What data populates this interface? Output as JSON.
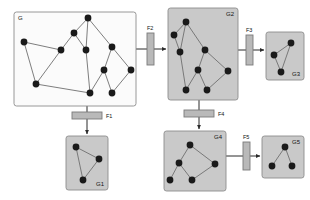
{
  "diagram": {
    "colors": {
      "panel_main_fill": "#fbfbfb",
      "panel_sub_fill": "#c9c9c9",
      "panel_stroke": "#8d8d8d",
      "node_fill": "#1a1a1a",
      "edge_stroke": "#6f6f6f",
      "filter_fill": "#b9b9b9",
      "filter_stroke": "#7a7a7a",
      "arrow_stroke": "#2b2b2b",
      "background": "#ffffff"
    },
    "panels": [
      {
        "id": "G",
        "label": "G",
        "label_pos": "top-left",
        "x": 14,
        "y": 12,
        "w": 122,
        "h": 94,
        "variant": "main",
        "nodes": [
          {
            "id": "n1",
            "x": 24,
            "y": 42
          },
          {
            "id": "n2",
            "x": 36,
            "y": 84
          },
          {
            "id": "n3",
            "x": 61,
            "y": 50
          },
          {
            "id": "n4",
            "x": 74,
            "y": 33
          },
          {
            "id": "n5",
            "x": 86,
            "y": 50
          },
          {
            "id": "n6",
            "x": 88,
            "y": 18
          },
          {
            "id": "n7",
            "x": 112,
            "y": 47
          },
          {
            "id": "n8",
            "x": 104,
            "y": 70
          },
          {
            "id": "n9",
            "x": 90,
            "y": 93
          },
          {
            "id": "n10",
            "x": 112,
            "y": 93
          },
          {
            "id": "n11",
            "x": 131,
            "y": 70
          }
        ],
        "edges": [
          [
            "n1",
            "n2"
          ],
          [
            "n1",
            "n3"
          ],
          [
            "n2",
            "n3"
          ],
          [
            "n3",
            "n4"
          ],
          [
            "n4",
            "n5"
          ],
          [
            "n4",
            "n6"
          ],
          [
            "n5",
            "n6"
          ],
          [
            "n5",
            "n9"
          ],
          [
            "n6",
            "n7"
          ],
          [
            "n7",
            "n8"
          ],
          [
            "n7",
            "n11"
          ],
          [
            "n8",
            "n9"
          ],
          [
            "n8",
            "n10"
          ],
          [
            "n10",
            "n11"
          ],
          [
            "n9",
            "n2"
          ]
        ]
      },
      {
        "id": "G2",
        "label": "G2",
        "label_pos": "top-right",
        "x": 168,
        "y": 8,
        "w": 70,
        "h": 92,
        "variant": "sub",
        "nodes": [
          {
            "id": "a1",
            "x": 186,
            "y": 22
          },
          {
            "id": "a2",
            "x": 174,
            "y": 35
          },
          {
            "id": "a3",
            "x": 180,
            "y": 52
          },
          {
            "id": "a4",
            "x": 205,
            "y": 50
          },
          {
            "id": "a5",
            "x": 198,
            "y": 70
          },
          {
            "id": "a6",
            "x": 228,
            "y": 71
          },
          {
            "id": "a7",
            "x": 186,
            "y": 90
          },
          {
            "id": "a8",
            "x": 207,
            "y": 90
          }
        ],
        "edges": [
          [
            "a1",
            "a2"
          ],
          [
            "a1",
            "a3"
          ],
          [
            "a1",
            "a4"
          ],
          [
            "a2",
            "a3"
          ],
          [
            "a3",
            "a7"
          ],
          [
            "a4",
            "a5"
          ],
          [
            "a4",
            "a6"
          ],
          [
            "a5",
            "a7"
          ],
          [
            "a5",
            "a8"
          ],
          [
            "a6",
            "a8"
          ]
        ]
      },
      {
        "id": "G3",
        "label": "G3",
        "label_pos": "bottom-right",
        "x": 266,
        "y": 32,
        "w": 38,
        "h": 48,
        "variant": "sub",
        "nodes": [
          {
            "id": "b1",
            "x": 291,
            "y": 43
          },
          {
            "id": "b2",
            "x": 274,
            "y": 55
          },
          {
            "id": "b3",
            "x": 281,
            "y": 72
          }
        ],
        "edges": [
          [
            "b1",
            "b2"
          ],
          [
            "b1",
            "b3"
          ],
          [
            "b2",
            "b3"
          ]
        ]
      },
      {
        "id": "G1",
        "label": "G1",
        "label_pos": "bottom-right",
        "x": 66,
        "y": 136,
        "w": 42,
        "h": 54,
        "variant": "sub",
        "nodes": [
          {
            "id": "c1",
            "x": 76,
            "y": 147
          },
          {
            "id": "c2",
            "x": 99,
            "y": 159
          },
          {
            "id": "c3",
            "x": 83,
            "y": 180
          }
        ],
        "edges": [
          [
            "c1",
            "c2"
          ],
          [
            "c1",
            "c3"
          ],
          [
            "c2",
            "c3"
          ]
        ]
      },
      {
        "id": "G4",
        "label": "G4",
        "label_pos": "top-right",
        "x": 164,
        "y": 131,
        "w": 62,
        "h": 60,
        "variant": "sub",
        "nodes": [
          {
            "id": "d1",
            "x": 190,
            "y": 145
          },
          {
            "id": "d2",
            "x": 179,
            "y": 163
          },
          {
            "id": "d3",
            "x": 215,
            "y": 164
          },
          {
            "id": "d4",
            "x": 170,
            "y": 180
          },
          {
            "id": "d5",
            "x": 192,
            "y": 180
          }
        ],
        "edges": [
          [
            "d1",
            "d2"
          ],
          [
            "d1",
            "d3"
          ],
          [
            "d2",
            "d4"
          ],
          [
            "d2",
            "d5"
          ],
          [
            "d3",
            "d5"
          ]
        ]
      },
      {
        "id": "G5",
        "label": "G5",
        "label_pos": "top-right",
        "x": 262,
        "y": 136,
        "w": 42,
        "h": 42,
        "variant": "sub",
        "nodes": [
          {
            "id": "e1",
            "x": 285,
            "y": 147
          },
          {
            "id": "e2",
            "x": 272,
            "y": 166
          },
          {
            "id": "e3",
            "x": 292,
            "y": 166
          }
        ],
        "edges": [
          [
            "e1",
            "e2"
          ],
          [
            "e1",
            "e3"
          ]
        ]
      }
    ],
    "filters": [
      {
        "id": "F1",
        "label": "F1",
        "orientation": "horizontal",
        "x": 72,
        "y": 112,
        "w": 30,
        "h": 7,
        "label_x": 106,
        "label_y": 118
      },
      {
        "id": "F2",
        "label": "F2",
        "orientation": "vertical",
        "x": 147,
        "y": 33,
        "w": 7,
        "h": 32,
        "label_x": 147,
        "label_y": 30
      },
      {
        "id": "F3",
        "label": "F3",
        "orientation": "vertical",
        "x": 246,
        "y": 35,
        "w": 7,
        "h": 30,
        "label_x": 246,
        "label_y": 32
      },
      {
        "id": "F4",
        "label": "F4",
        "orientation": "horizontal",
        "x": 184,
        "y": 110,
        "w": 30,
        "h": 7,
        "label_x": 218,
        "label_y": 116
      },
      {
        "id": "F5",
        "label": "F5",
        "orientation": "vertical",
        "x": 243,
        "y": 142,
        "w": 7,
        "h": 28,
        "label_x": 243,
        "label_y": 139
      }
    ],
    "connectors": [
      {
        "id": "G-to-F2",
        "from": "G",
        "to": "F2",
        "path": "M136,49 L147,49",
        "arrow": false
      },
      {
        "id": "F2-to-G2",
        "from": "F2",
        "to": "G2",
        "path": "M154,49 L166,49",
        "arrow": true
      },
      {
        "id": "G2-to-F3",
        "from": "G2",
        "to": "F3",
        "path": "M238,50 L246,50",
        "arrow": false
      },
      {
        "id": "F3-to-G3",
        "from": "F3",
        "to": "G3",
        "path": "M253,50 L264,50",
        "arrow": true
      },
      {
        "id": "G-to-F1",
        "from": "G",
        "to": "F1",
        "path": "M87,106 L87,112",
        "arrow": false
      },
      {
        "id": "F1-to-G1",
        "from": "F1",
        "to": "G1",
        "path": "M87,119 L87,134",
        "arrow": true
      },
      {
        "id": "G2-to-F4",
        "from": "G2",
        "to": "F4",
        "path": "M199,100 L199,110",
        "arrow": false
      },
      {
        "id": "F4-to-G4",
        "from": "F4",
        "to": "G4",
        "path": "M199,117 L199,129",
        "arrow": true
      },
      {
        "id": "G4-to-F5",
        "from": "G4",
        "to": "F5",
        "path": "M226,156 L243,156",
        "arrow": false
      },
      {
        "id": "F5-to-G5",
        "from": "F5",
        "to": "G5",
        "path": "M250,156 L260,156",
        "arrow": true
      }
    ]
  }
}
